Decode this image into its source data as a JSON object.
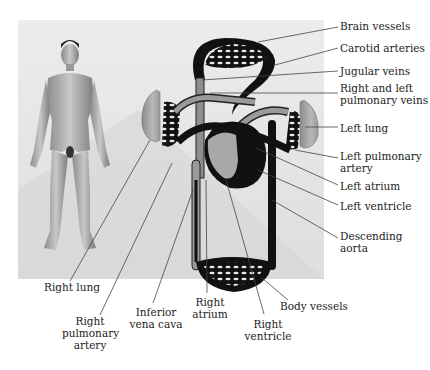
{
  "figure": {
    "type": "circulatory-system-diagram",
    "labels_right": [
      {
        "id": "brain-vessels",
        "text": "Brain vessels"
      },
      {
        "id": "carotid-arteries",
        "text": "Carotid arteries"
      },
      {
        "id": "jugular-veins",
        "text": "Jugular veins"
      },
      {
        "id": "pulmonary-veins",
        "line1": "Right and left",
        "line2": "pulmonary veins"
      },
      {
        "id": "left-lung",
        "text": "Left lung"
      },
      {
        "id": "left-pulmonary-artery",
        "line1": "Left pulmonary",
        "line2": "artery"
      },
      {
        "id": "left-atrium",
        "text": "Left atrium"
      },
      {
        "id": "left-ventricle",
        "text": "Left ventricle"
      },
      {
        "id": "descending-aorta",
        "line1": "Descending",
        "line2": "aorta"
      }
    ],
    "labels_bottom": [
      {
        "id": "right-lung",
        "text": "Right lung"
      },
      {
        "id": "right-pulmonary-artery",
        "line1": "Right",
        "line2": "pulmonary",
        "line3": "artery"
      },
      {
        "id": "inferior-vena-cava",
        "line1": "Inferior",
        "line2": "vena cava"
      },
      {
        "id": "right-atrium",
        "line1": "Right",
        "line2": "atrium"
      },
      {
        "id": "right-ventricle",
        "line1": "Right",
        "line2": "ventricle"
      },
      {
        "id": "body-vessels",
        "text": "Body vessels"
      }
    ],
    "colors": {
      "panel": "#e4e4e4",
      "vessel_dark": "#1a1a1a",
      "vessel_light": "#9a9a9a",
      "lung": "#a8a8a8",
      "leader_line": "#444444",
      "text": "#222222"
    }
  }
}
